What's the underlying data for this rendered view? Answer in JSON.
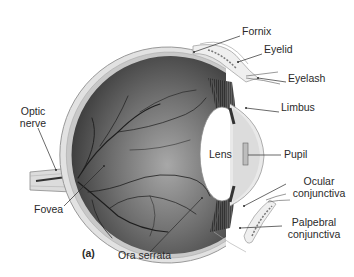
{
  "figure": {
    "panel_label": "(a)",
    "labels": {
      "fornix": "Fornix",
      "eyelid": "Eyelid",
      "eyelash": "Eyelash",
      "limbus": "Limbus",
      "lens": "Lens",
      "pupil": "Pupil",
      "ocular_conjunctiva_1": "Ocular",
      "ocular_conjunctiva_2": "conjunctiva",
      "palpebral_conjunctiva_1": "Palpebral",
      "palpebral_conjunctiva_2": "conjunctiva",
      "optic_nerve_1": "Optic",
      "optic_nerve_2": "nerve",
      "fovea": "Fovea",
      "ora_serrata": "Ora serrata"
    },
    "colors": {
      "background": "#ffffff",
      "eye_dark": "#3a3a3a",
      "eye_light": "#9a9a9a",
      "sclera": "#d8d8d8",
      "vessels": "#1e1e1e",
      "label_text": "#2a2a2a"
    }
  }
}
